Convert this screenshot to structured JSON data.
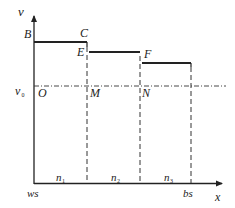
{
  "diagram": {
    "type": "step-velocity-vs-position",
    "axes": {
      "y_label": "v",
      "x_label": "x",
      "origin_label": "ws",
      "end_label": "bs"
    },
    "baseline": {
      "label": "v",
      "label_sub": "0"
    },
    "points": {
      "B": "B",
      "C": "C",
      "E": "E",
      "F": "F",
      "O": "O",
      "M": "M",
      "N": "N"
    },
    "segments": [
      {
        "label": "n",
        "sub": "1"
      },
      {
        "label": "n",
        "sub": "2"
      },
      {
        "label": "n",
        "sub": "3"
      }
    ],
    "colors": {
      "line": "#222222",
      "dash": "#333333"
    }
  }
}
